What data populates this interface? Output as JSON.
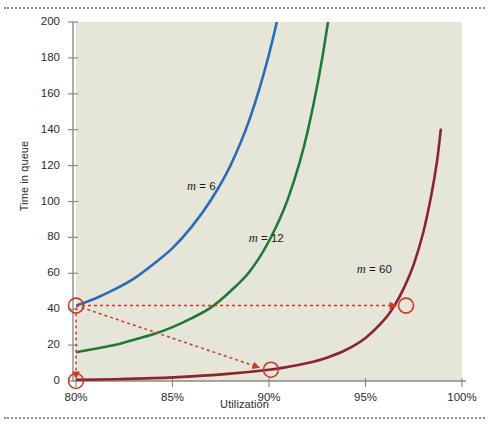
{
  "figure": {
    "background": "#ffffff",
    "plot_background": "#e5e6d8",
    "rule_color": "#8c8c88",
    "top_rule_name": "top-dotted-rule",
    "bottom_rule_name": "bottom-dotted-rule"
  },
  "chart_data": {
    "type": "line",
    "title": "",
    "xlabel": "Utilization",
    "ylabel": "Time in queue",
    "xlim": [
      80,
      100
    ],
    "ylim": [
      0,
      200
    ],
    "grid": false,
    "legend_position": "inline-labels",
    "xticks": [
      80,
      85,
      90,
      95,
      100
    ],
    "xtick_labels": [
      "80%",
      "85%",
      "90%",
      "95%",
      "100%"
    ],
    "yticks": [
      0,
      20,
      40,
      60,
      80,
      100,
      120,
      140,
      160,
      180,
      200
    ],
    "ytick_labels": [
      "0",
      "20",
      "40",
      "60",
      "80",
      "100",
      "120",
      "140",
      "160",
      "180",
      "200"
    ],
    "series": [
      {
        "name": "m = 6",
        "label_html": "<span class=\"var\">m</span> = 6",
        "color": "#2b6cb8",
        "label_x": 87.1,
        "label_y": 108,
        "x": [
          80,
          81,
          82,
          83,
          84,
          85,
          86,
          87,
          88,
          89,
          90,
          90.8,
          91.4
        ],
        "y": [
          42,
          46,
          51,
          57,
          65,
          74,
          86,
          101,
          120,
          146,
          182,
          220,
          256
        ]
      },
      {
        "name": "m = 12",
        "label_html": "<span class=\"var\">m</span> = 12",
        "color": "#1e7a35",
        "label_x": 90.3,
        "label_y": 79,
        "x": [
          80,
          81,
          82,
          83,
          84,
          85,
          86,
          87,
          88,
          89,
          90,
          91,
          92,
          93,
          94,
          94.6,
          95.1
        ],
        "y": [
          16,
          18,
          20,
          23,
          26,
          30,
          35,
          41,
          50,
          61,
          78,
          102,
          139,
          196,
          283,
          360,
          430
        ]
      },
      {
        "name": "m = 60",
        "label_html": "<span class=\"var\">m</span> = 60",
        "color": "#8b2332",
        "label_x": 95.9,
        "label_y": 62,
        "x": [
          80,
          82,
          84,
          86,
          88,
          90,
          91,
          92,
          93,
          94,
          95,
          96,
          96.5,
          97,
          97.5,
          98,
          98.4,
          98.7,
          98.9
        ],
        "y": [
          0.6,
          1.0,
          1.6,
          2.6,
          4.1,
          6.3,
          7.9,
          10.0,
          13.0,
          17.4,
          24.0,
          34.5,
          42,
          52,
          65,
          83,
          103,
          122,
          140
        ]
      }
    ],
    "annotations": [
      {
        "name": "marker-80-42",
        "type": "circle-marker",
        "x": 80,
        "y": 42,
        "color": "#c83b2c",
        "series": "m = 6"
      },
      {
        "name": "marker-80-0",
        "type": "circle-marker",
        "x": 80,
        "y": 0,
        "color": "#c83b2c",
        "series": "m = 60"
      },
      {
        "name": "marker-90-6",
        "type": "circle-marker",
        "x": 90.1,
        "y": 6.3,
        "color": "#c83b2c",
        "series": "m = 60"
      },
      {
        "name": "marker-97-42",
        "type": "circle-marker",
        "x": 97.1,
        "y": 42,
        "color": "#c83b2c",
        "series": "m = 60"
      },
      {
        "name": "arrow-horizontal-42",
        "type": "dotted-arrow",
        "from": [
          80,
          42
        ],
        "to": [
          96.6,
          42
        ],
        "color": "#c83b2c"
      },
      {
        "name": "arrow-diagonal-to-90",
        "type": "dotted-arrow",
        "from": [
          80,
          42
        ],
        "to": [
          89.5,
          7.5
        ],
        "color": "#c83b2c"
      },
      {
        "name": "arrow-vertical-down",
        "type": "dotted-arrow",
        "from": [
          80,
          41
        ],
        "to": [
          80,
          1.5
        ],
        "color": "#c83b2c"
      }
    ]
  }
}
